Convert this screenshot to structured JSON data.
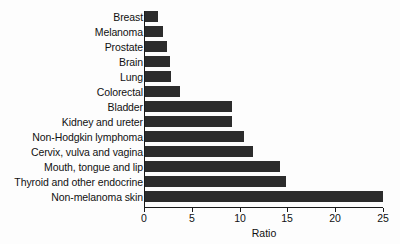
{
  "chart_data": {
    "type": "bar",
    "orientation": "horizontal",
    "title": "",
    "xlabel": "Ratio",
    "ylabel": "",
    "xlim": [
      0,
      25
    ],
    "xticks": [
      0,
      5,
      10,
      15,
      20,
      25
    ],
    "grid": false,
    "legend": null,
    "bar_color": "#2c2c2c",
    "categories": [
      "Breast",
      "Melanoma",
      "Prostate",
      "Brain",
      "Lung",
      "Colorectal",
      "Bladder",
      "Kidney and ureter",
      "Non-Hodgkin lymphoma",
      "Cervix, vulva and vagina",
      "Mouth, tongue and lip",
      "Thyroid and other endocrine",
      "Non-melanoma skin"
    ],
    "values": [
      1.4,
      1.9,
      2.3,
      2.6,
      2.7,
      3.7,
      9.1,
      9.1,
      10.4,
      11.3,
      14.2,
      14.8,
      25.0
    ]
  }
}
